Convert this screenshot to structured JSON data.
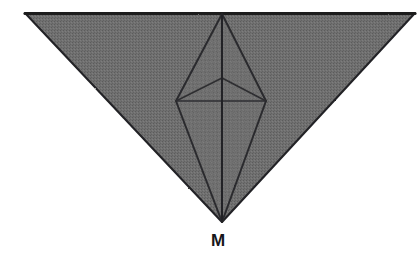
{
  "figure": {
    "kind": "hand-drawn-geometry-diagram",
    "background_color": "#ffffff",
    "fill_color": "#6e6e6e",
    "fill_color_light": "#757575",
    "fill_color_dark": "#656565",
    "stroke_color": "#232326",
    "inner_stroke_color": "#2b2b2e",
    "canvas": {
      "width": 419,
      "height": 280
    },
    "outer_triangle": {
      "name": "outer-triangle",
      "points": "25,13 415,13 222,222",
      "top_left": {
        "x": 25,
        "y": 13
      },
      "top_right": {
        "x": 415,
        "y": 13
      },
      "bottom_apex": {
        "x": 222,
        "y": 222
      }
    },
    "inner_bipyramid": {
      "name": "inner-bipyramid",
      "top_apex": {
        "x": 222,
        "y": 14
      },
      "left_waist": {
        "x": 176,
        "y": 101
      },
      "right_waist": {
        "x": 266,
        "y": 101
      },
      "bottom_apex": {
        "x": 222,
        "y": 222
      },
      "mid_vertex": {
        "x": 222,
        "y": 78
      },
      "outline_points": "222,14 266,101 222,222 176,101"
    },
    "edges": [
      {
        "name": "edge-top-apex-to-left-waist",
        "x1": 222,
        "y1": 14,
        "x2": 176,
        "y2": 101
      },
      {
        "name": "edge-top-apex-to-right-waist",
        "x1": 222,
        "y1": 14,
        "x2": 266,
        "y2": 101
      },
      {
        "name": "edge-left-waist-to-bottom-apex",
        "x1": 176,
        "y1": 101,
        "x2": 222,
        "y2": 222
      },
      {
        "name": "edge-right-waist-to-bottom-apex",
        "x1": 266,
        "y1": 101,
        "x2": 222,
        "y2": 222
      },
      {
        "name": "edge-mid-vertex-to-left-waist",
        "x1": 222,
        "y1": 78,
        "x2": 176,
        "y2": 101
      },
      {
        "name": "edge-mid-vertex-to-right-waist",
        "x1": 222,
        "y1": 78,
        "x2": 266,
        "y2": 101
      },
      {
        "name": "edge-waist-horizontal",
        "x1": 176,
        "y1": 101,
        "x2": 266,
        "y2": 101
      },
      {
        "name": "edge-vertical-axis",
        "x1": 222,
        "y1": 14,
        "x2": 222,
        "y2": 222
      }
    ],
    "labels": [
      {
        "name": "vertex-label-m",
        "text": "M",
        "x": 211,
        "y": 232,
        "refers_to": "bottom-apex"
      }
    ]
  }
}
